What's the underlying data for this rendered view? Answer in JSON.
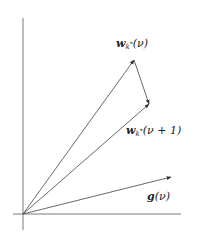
{
  "diagram": {
    "origin": [
      23,
      214
    ],
    "axes": {
      "x": {
        "from": [
          13,
          214
        ],
        "to": [
          181,
          214
        ]
      },
      "y": {
        "from": [
          23,
          18
        ],
        "to": [
          23,
          230
        ]
      }
    },
    "vectors": [
      {
        "name": "w_k*(nu)",
        "from": [
          23,
          214
        ],
        "to": [
          134,
          60
        ]
      },
      {
        "name": "w_k*(nu+1)",
        "from": [
          23,
          214
        ],
        "to": [
          149,
          104
        ]
      },
      {
        "name": "g(nu)",
        "from": [
          23,
          214
        ],
        "to": [
          171,
          177
        ]
      },
      {
        "name": "update",
        "from": [
          134,
          60
        ],
        "to": [
          149,
          104
        ]
      }
    ],
    "labels": {
      "w_nu": {
        "vec": "w",
        "sub": "k",
        "sup": "*",
        "arg": "(ν)"
      },
      "w_nu1": {
        "vec": "w",
        "sub": "k",
        "sup": "*",
        "arg": "(ν + 1)"
      },
      "g_nu": {
        "vec": "g",
        "arg": "(ν)"
      }
    },
    "colors": {
      "line": "#444444",
      "text": "#222222"
    }
  }
}
